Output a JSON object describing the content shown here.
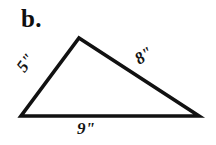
{
  "figure": {
    "problem_label": "b.",
    "background_color": "#ffffff",
    "stroke_color": "#111111",
    "shape": "triangle",
    "labels": {
      "left_side": "5\"",
      "right_side": "8\"",
      "base": "9\""
    },
    "geometry": {
      "apex": [
        79,
        38
      ],
      "bottom_left": [
        21,
        116
      ],
      "bottom_right": [
        199,
        116
      ],
      "stroke_width": 3.6
    }
  }
}
